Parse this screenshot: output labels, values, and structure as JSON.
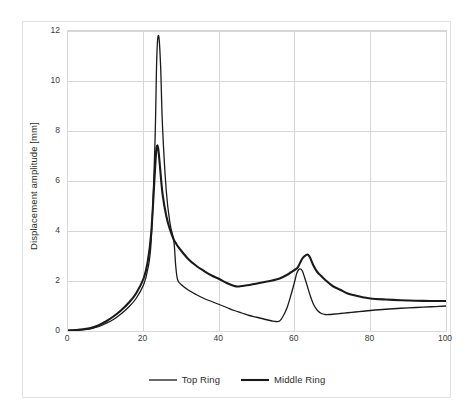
{
  "chart_data": {
    "type": "line",
    "title": "",
    "xlabel": "Frequency of excitation [Hz]",
    "ylabel": "Displacement amplitude [mm]",
    "xlim": [
      0,
      100
    ],
    "ylim": [
      0,
      12
    ],
    "xticks": [
      0,
      20,
      40,
      60,
      80,
      100
    ],
    "yticks": [
      0,
      2,
      4,
      6,
      8,
      10,
      12
    ],
    "xtick_labels": [
      "0",
      "20",
      "40",
      "60",
      "80",
      "100"
    ],
    "ytick_labels": [
      "0",
      "2",
      "4",
      "6",
      "8",
      "10",
      "12"
    ],
    "grid": "both-major",
    "legend_position": "bottom-center",
    "series": [
      {
        "name": "Top Ring",
        "color": "#1a1a1a",
        "line_width": 1.3,
        "x": [
          0,
          2,
          4,
          6,
          8,
          10,
          12,
          14,
          16,
          18,
          20,
          21,
          22,
          23,
          23.5,
          24,
          24.5,
          25,
          26,
          27,
          28,
          28.5,
          29,
          30,
          32,
          34,
          36,
          38,
          40,
          42,
          44,
          46,
          48,
          50,
          52,
          54,
          55,
          56,
          57,
          58,
          59,
          60,
          60.5,
          61,
          61.5,
          62,
          63,
          64,
          65,
          66,
          67,
          68,
          69,
          70,
          72,
          74,
          76,
          78,
          80,
          84,
          88,
          92,
          96,
          100
        ],
        "y": [
          0.02,
          0.03,
          0.05,
          0.09,
          0.17,
          0.3,
          0.46,
          0.68,
          0.95,
          1.3,
          1.85,
          2.4,
          3.6,
          7.5,
          11.0,
          11.8,
          10.6,
          8.2,
          5.6,
          4.3,
          3.6,
          2.6,
          2.05,
          1.85,
          1.62,
          1.45,
          1.3,
          1.18,
          1.06,
          0.94,
          0.82,
          0.72,
          0.62,
          0.55,
          0.47,
          0.4,
          0.38,
          0.4,
          0.62,
          0.95,
          1.45,
          2.0,
          2.3,
          2.45,
          2.48,
          2.4,
          1.95,
          1.45,
          1.05,
          0.82,
          0.7,
          0.66,
          0.66,
          0.67,
          0.7,
          0.73,
          0.76,
          0.79,
          0.82,
          0.87,
          0.91,
          0.94,
          0.97,
          1.0
        ]
      },
      {
        "name": "Middle Ring",
        "color": "#1a1a1a",
        "line_width": 2.1,
        "x": [
          0,
          2,
          4,
          6,
          8,
          10,
          12,
          14,
          16,
          18,
          20,
          21,
          22,
          23,
          23.4,
          23.8,
          24.2,
          25,
          26,
          27,
          28,
          28.6,
          29,
          30,
          32,
          34,
          36,
          38,
          40,
          42,
          44,
          45,
          46,
          48,
          50,
          52,
          54,
          56,
          58,
          59,
          60,
          60.5,
          61,
          62,
          63,
          63.5,
          64,
          65,
          66,
          67,
          68,
          70,
          72,
          74,
          76,
          78,
          80,
          84,
          88,
          92,
          96,
          100
        ],
        "y": [
          0.02,
          0.04,
          0.07,
          0.12,
          0.22,
          0.38,
          0.58,
          0.82,
          1.12,
          1.5,
          2.1,
          2.7,
          3.9,
          6.4,
          7.3,
          7.35,
          6.8,
          5.5,
          4.6,
          4.05,
          3.65,
          3.5,
          3.4,
          3.2,
          2.85,
          2.6,
          2.4,
          2.22,
          2.08,
          1.92,
          1.8,
          1.78,
          1.8,
          1.84,
          1.9,
          1.96,
          2.02,
          2.1,
          2.25,
          2.35,
          2.45,
          2.5,
          2.6,
          2.9,
          3.04,
          3.05,
          2.95,
          2.6,
          2.35,
          2.2,
          2.05,
          1.8,
          1.65,
          1.5,
          1.42,
          1.35,
          1.3,
          1.26,
          1.23,
          1.21,
          1.2,
          1.2
        ]
      }
    ],
    "annotations": []
  },
  "legend": {
    "items": [
      {
        "label": "Top Ring"
      },
      {
        "label": "Middle Ring"
      }
    ]
  },
  "axes": {
    "y_title": "Displacement amplitude [mm]",
    "x_title": "Frequency of excitation [Hz]"
  },
  "colors": {
    "series_line": "#1a1a1a",
    "gridline": "#d6d6d6",
    "plot_border": "#d8d8d8",
    "outer_border": "#e2e2e2",
    "tick_text": "#3a3a3a",
    "title_text": "#2b2b2b",
    "background": "#ffffff"
  }
}
